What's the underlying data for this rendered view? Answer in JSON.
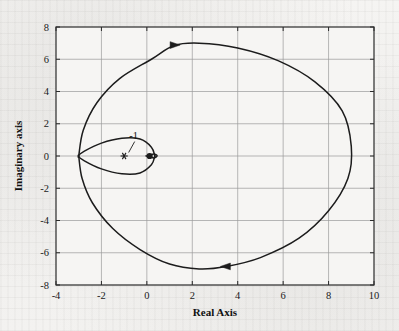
{
  "figure": {
    "background_color": "#f2f1ef",
    "plot_background_color": "#f6f5f3",
    "frame_color": "#2b2b2b",
    "grid_color": "#9a9a9a",
    "curve_color": "#1c1c1c"
  },
  "chart_data": {
    "type": "line",
    "title": "",
    "subtitle": "",
    "xlabel": "Real Axis",
    "ylabel": "Imaginary axis",
    "xlim": [
      -4,
      10
    ],
    "ylim": [
      -8,
      8
    ],
    "xticks": [
      -4,
      -2,
      0,
      2,
      4,
      6,
      8,
      10
    ],
    "xticklabels": [
      "-4",
      "-2",
      "0",
      "2",
      "4",
      "6",
      "8",
      "10"
    ],
    "yticks": [
      -8,
      -6,
      -4,
      -2,
      0,
      2,
      4,
      6,
      8
    ],
    "yticklabels": [
      "-8",
      "-6",
      "-4",
      "-2",
      "0",
      "2",
      "4",
      "6",
      "8"
    ],
    "grid": true,
    "legend": null,
    "legend_position": "none",
    "series": [
      {
        "name": "Nyquist contour - outer loop",
        "closed": true,
        "points": [
          [
            0.35,
            0.02
          ],
          [
            0.2,
            0.55
          ],
          [
            -0.3,
            1.05
          ],
          [
            -1.1,
            1.1
          ],
          [
            -2.0,
            0.8
          ],
          [
            -2.75,
            0.3
          ],
          [
            -3.0,
            0.0
          ],
          [
            -2.75,
            -0.3
          ],
          [
            -2.0,
            -0.8
          ],
          [
            -1.1,
            -1.1
          ],
          [
            -0.3,
            -1.05
          ],
          [
            0.2,
            -0.55
          ],
          [
            0.35,
            -0.02
          ]
        ]
      },
      {
        "name": "Nyquist contour - small loop",
        "closed": true,
        "points": [
          [
            0.0,
            0.0
          ],
          [
            0.3,
            0.12
          ],
          [
            0.45,
            0.02
          ],
          [
            0.32,
            -0.12
          ],
          [
            0.0,
            0.0
          ]
        ]
      },
      {
        "name": "Nyquist contour - large loop",
        "closed": true,
        "points": [
          [
            -3.0,
            0.0
          ],
          [
            -2.8,
            1.6
          ],
          [
            -2.2,
            3.3
          ],
          [
            -1.2,
            4.8
          ],
          [
            0.2,
            6.0
          ],
          [
            1.2,
            6.85
          ],
          [
            2.3,
            7.0
          ],
          [
            4.0,
            6.7
          ],
          [
            5.8,
            5.9
          ],
          [
            7.4,
            4.6
          ],
          [
            8.6,
            2.8
          ],
          [
            9.0,
            0.6
          ],
          [
            8.85,
            -1.4
          ],
          [
            8.0,
            -3.4
          ],
          [
            6.7,
            -5.1
          ],
          [
            5.0,
            -6.3
          ],
          [
            3.5,
            -6.85
          ],
          [
            2.3,
            -7.0
          ],
          [
            1.0,
            -6.7
          ],
          [
            -0.3,
            -5.8
          ],
          [
            -1.5,
            -4.5
          ],
          [
            -2.4,
            -2.9
          ],
          [
            -2.85,
            -1.4
          ],
          [
            -3.0,
            0.0
          ]
        ]
      }
    ],
    "markers": [
      {
        "name": "critical-point",
        "glyph": "asterisk",
        "x": -1.0,
        "y": 0.0,
        "label": "-1"
      },
      {
        "name": "origin-point",
        "glyph": "filled-circle",
        "x": 0.12,
        "y": 0.0,
        "label": ""
      }
    ],
    "annotations": [
      {
        "name": "minus-one-annotation",
        "text": "-1",
        "x": -0.58,
        "y": 1.05,
        "points_to_x": -1.0,
        "points_to_y": 0.0
      }
    ],
    "direction_arrows": [
      {
        "name": "arrow-top",
        "x": 1.2,
        "y": 6.88,
        "direction": "right"
      },
      {
        "name": "arrow-bottom",
        "x": 3.5,
        "y": -6.85,
        "direction": "left"
      }
    ]
  }
}
